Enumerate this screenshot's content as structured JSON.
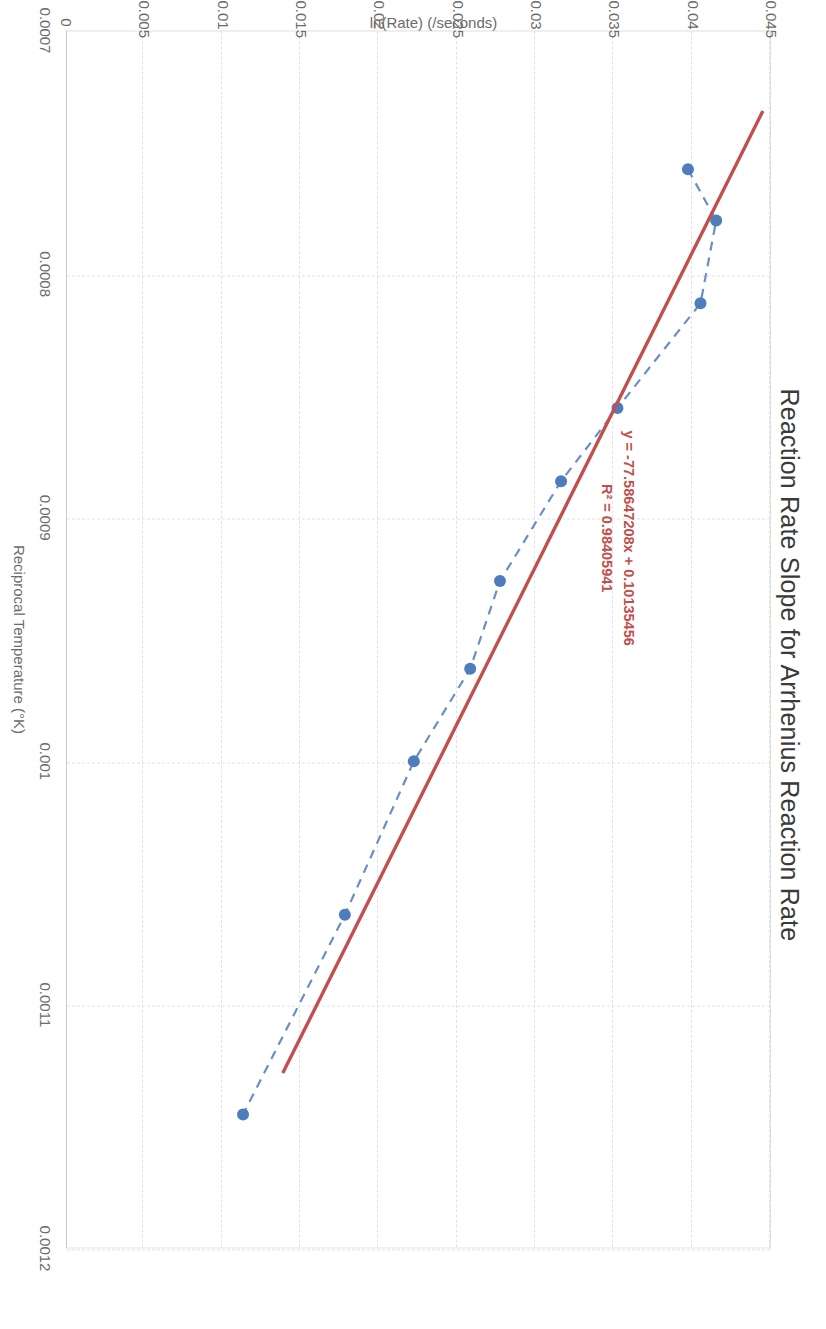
{
  "chart_data": {
    "type": "scatter",
    "title": "Reaction Rate Slope for Arrhenius Reaction Rate",
    "xlabel": "Reciprocal Temperature (°K)",
    "ylabel": "ln(Rate) (/seconds)",
    "xlim": [
      0.0007,
      0.0012
    ],
    "ylim": [
      0,
      0.045
    ],
    "xticks": [
      "0.0007",
      "0.0008",
      "0.0009",
      "0.001",
      "0.0011",
      "0.0012"
    ],
    "xtick_values": [
      0.0007,
      0.0008,
      0.0009,
      0.001,
      0.0011,
      0.0012
    ],
    "yticks": [
      "0",
      "0.005",
      "0.01",
      "0.015",
      "0.02",
      "0.025",
      "0.03",
      "0.035",
      "0.04",
      "0.045"
    ],
    "ytick_values": [
      0,
      0.005,
      0.01,
      0.015,
      0.02,
      0.025,
      0.03,
      0.035,
      0.04,
      0.045
    ],
    "grid": true,
    "legend": "none",
    "series": [
      {
        "name": "Reaction Rate",
        "marker": "circle",
        "marker_color": "#4f7cba",
        "line_style": "dashed",
        "line_color": "#6b8fc4",
        "x": [
          0.000757,
          0.000778,
          0.000812,
          0.000855,
          0.000885,
          0.000926,
          0.000962,
          0.001,
          0.001063,
          0.001145
        ],
        "y": [
          0.0397,
          0.0415,
          0.0405,
          0.0352,
          0.0316,
          0.0277,
          0.0258,
          0.0222,
          0.0178,
          0.0113
        ]
      }
    ],
    "trendline": {
      "name": "Linear trendline",
      "color": "#c0504d",
      "line_style": "solid",
      "slope": -77.58647208,
      "intercept": 0.10135456,
      "r_squared": 0.98405941,
      "equation_label": "y = -77.58647208x + 0.10135456",
      "r2_label": "R² = 0.98405941",
      "x_start": 0.000733,
      "x_end": 0.001128
    },
    "annotations": [
      {
        "name": "trendline-equation",
        "text": "y = -77.58647208x + 0.10135456"
      },
      {
        "name": "trendline-r2",
        "text": "R² = 0.98405941"
      }
    ]
  },
  "colors": {
    "marker": "#4f7cba",
    "series_line": "#6b8fc4",
    "trendline": "#c0504d",
    "grid": "#e2e2e2",
    "axis": "#c9c9c9",
    "title_text": "#3a3a3a",
    "tick_text": "#6b6b6b",
    "background": "#ffffff"
  }
}
